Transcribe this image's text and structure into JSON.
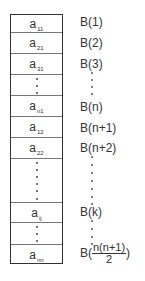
{
  "diagram": {
    "type": "memory-layout",
    "cells": [
      {
        "label": "a",
        "sub": "11",
        "kind": "value"
      },
      {
        "label": "a",
        "sub": "21",
        "kind": "value"
      },
      {
        "label": "a",
        "sub": "31",
        "kind": "value"
      },
      {
        "label": "",
        "sub": "",
        "kind": "ellipsis"
      },
      {
        "label": "a",
        "sub": "n1",
        "kind": "value"
      },
      {
        "label": "a",
        "sub": "12",
        "kind": "value"
      },
      {
        "label": "a",
        "sub": "22",
        "kind": "value"
      },
      {
        "label": "",
        "sub": "",
        "kind": "ellipsis"
      },
      {
        "label": "a",
        "sub": "ij",
        "kind": "value"
      },
      {
        "label": "",
        "sub": "",
        "kind": "ellipsis"
      },
      {
        "label": "a",
        "sub": "nn",
        "kind": "value"
      }
    ],
    "addresses": [
      {
        "text": "B(1)"
      },
      {
        "text": "B(2)"
      },
      {
        "text": "B(3)"
      },
      {
        "text": "B(n)"
      },
      {
        "text": "B(n+1)"
      },
      {
        "text": "B(n+2)"
      },
      {
        "text": "B(k)"
      },
      {
        "prefix": "B(",
        "numerator": "n(n+1)",
        "denominator": "2",
        "suffix": ")"
      }
    ]
  }
}
